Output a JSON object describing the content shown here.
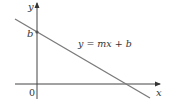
{
  "figure": {
    "type": "line-intercept-diagram",
    "axes": {
      "x_label": "x",
      "y_label": "y",
      "origin_label": "0"
    },
    "line": {
      "equation_label": "y = mx + b",
      "intercept_label": "b",
      "slope_sign": "negative"
    },
    "colors": {
      "axis": "#333333",
      "line": "#7a7a7a",
      "text": "#333333"
    }
  }
}
